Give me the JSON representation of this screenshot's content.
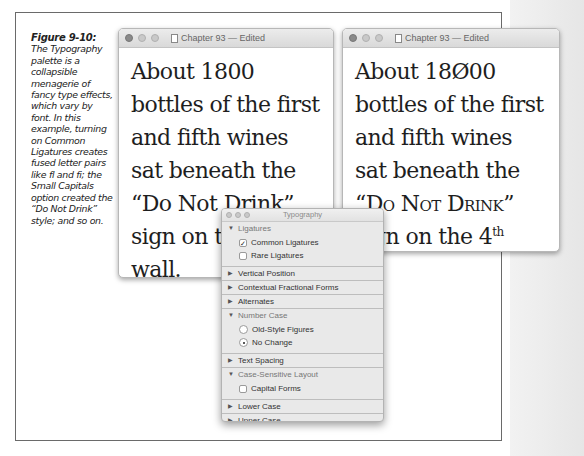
{
  "caption": {
    "figure_label": "Figure 9-10:",
    "text": "The Typography palette is a collapsible menagerie of fancy type effects, which vary by font. In this example, turning on Common Ligatures creates fused letter pairs like fl and fi; the Small Capitals option created the “Do Not Drink” style; and so on."
  },
  "window_left": {
    "title": "Chapter 93 — Edited",
    "text_before": "About 1800 bottles of the first and fifth wines sat beneath the “Do Not Drink” sign on the 4th wall."
  },
  "window_right": {
    "title": "Chapter 93 — Edited",
    "line1": "About 18Ø00 bottles of the first and fifth wines sat beneath the “",
    "smallcaps": "Do Not Drink",
    "after_sc": "” sign on the 4",
    "sup": "th",
    "end": " wall."
  },
  "palette": {
    "title": "Typography",
    "sections": [
      {
        "label": "Ligatures",
        "expanded": true,
        "options": [
          {
            "label": "Common Ligatures",
            "type": "checkbox",
            "checked": true
          },
          {
            "label": "Rare Ligatures",
            "type": "checkbox",
            "checked": false
          }
        ]
      },
      {
        "label": "Vertical Position",
        "expanded": false
      },
      {
        "label": "Contextual Fractional Forms",
        "expanded": false
      },
      {
        "label": "Alternates",
        "expanded": false
      },
      {
        "label": "Number Case",
        "expanded": true,
        "options": [
          {
            "label": "Old-Style Figures",
            "type": "radio",
            "checked": false
          },
          {
            "label": "No Change",
            "type": "radio",
            "checked": true
          }
        ]
      },
      {
        "label": "Text Spacing",
        "expanded": false
      },
      {
        "label": "Case-Sensitive Layout",
        "expanded": true,
        "options": [
          {
            "label": "Capital Forms",
            "type": "checkbox",
            "checked": false
          }
        ]
      },
      {
        "label": "Lower Case",
        "expanded": false
      },
      {
        "label": "Upper Case",
        "expanded": false
      }
    ]
  }
}
